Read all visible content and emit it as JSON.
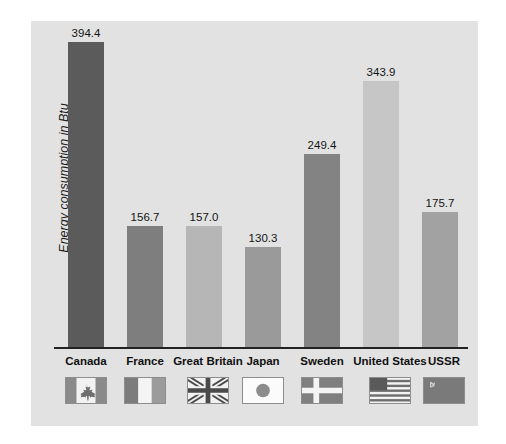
{
  "chart_data": {
    "type": "bar",
    "title": "",
    "subtitle": "",
    "xlabel": "",
    "ylabel": "Energy consumption in Btu",
    "categories": [
      "Canada",
      "France",
      "Great Britain",
      "Japan",
      "Sweden",
      "United States",
      "USSR"
    ],
    "values": [
      394.4,
      156.7,
      157.0,
      130.3,
      249.4,
      343.9,
      175.7
    ],
    "value_labels": [
      "394.4",
      "156.7",
      "157.0",
      "130.3",
      "249.4",
      "343.9",
      "175.7"
    ],
    "ylim": [
      0,
      420
    ],
    "grid": false,
    "legend_position": "bottom",
    "bar_colors": [
      "#5b5b5b",
      "#7e7e7e",
      "#b6b6b6",
      "#9a9a9a",
      "#838383",
      "#c6c6c6",
      "#a2a2a2"
    ],
    "series": [
      {
        "name": "Energy consumption in Btu",
        "values": [
          394.4,
          156.7,
          157.0,
          130.3,
          249.4,
          343.9,
          175.7
        ]
      }
    ]
  },
  "legend": {
    "items": [
      {
        "label": "Canada",
        "flag": "flag-canada"
      },
      {
        "label": "France",
        "flag": "flag-france"
      },
      {
        "label": "Great Britain",
        "flag": "flag-great-britain"
      },
      {
        "label": "Japan",
        "flag": "flag-japan"
      },
      {
        "label": "Sweden",
        "flag": "flag-sweden"
      },
      {
        "label": "United States",
        "flag": "flag-united-states"
      },
      {
        "label": "USSR",
        "flag": "flag-ussr"
      }
    ]
  },
  "style": {
    "panel_background": "#e2e2e2",
    "page_background": "#ffffff",
    "axis_color": "#222222",
    "text_color": "#141414"
  }
}
